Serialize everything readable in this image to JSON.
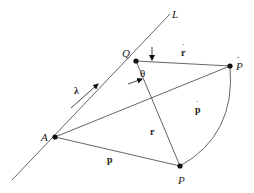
{
  "diagram": {
    "type": "geometric-vector-diagram",
    "labels": {
      "line": "L",
      "point_a": "A",
      "point_q": "Q",
      "point_p": "P",
      "point_p_hat": "P",
      "vector_lambda": "λ",
      "angle_theta": "θ",
      "vector_r_dot": "r",
      "vector_p_dot": "p",
      "vector_r": "r",
      "vector_p": "p"
    },
    "points": {
      "A": [
        55,
        137
      ],
      "Q": [
        136,
        61
      ],
      "P_hat": [
        230,
        66
      ],
      "P": [
        180,
        166
      ]
    },
    "colors": {
      "line": "#555555",
      "point": "#111111",
      "text": "#222222"
    }
  }
}
